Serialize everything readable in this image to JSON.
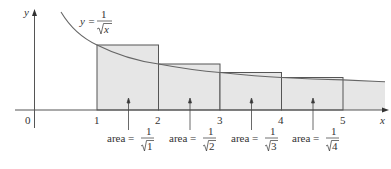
{
  "figure": {
    "axis_labels": {
      "x": "x",
      "y": "y"
    },
    "origin_label": "0",
    "x_ticks": [
      "1",
      "2",
      "3",
      "4",
      "5"
    ],
    "curve_label": {
      "lhs": "y =",
      "numerator": "1",
      "denominator": "x"
    },
    "area_labels": [
      {
        "prefix": "area =",
        "numerator": "1",
        "radicand": "1"
      },
      {
        "prefix": "area =",
        "numerator": "1",
        "radicand": "2"
      },
      {
        "prefix": "area =",
        "numerator": "1",
        "radicand": "3"
      },
      {
        "prefix": "area =",
        "numerator": "1",
        "radicand": "4"
      }
    ],
    "colors": {
      "rect_fill": "#e6e6e6",
      "rect_stroke": "#555555",
      "curve": "#666666",
      "axis": "#555555",
      "text": "#333333"
    }
  }
}
